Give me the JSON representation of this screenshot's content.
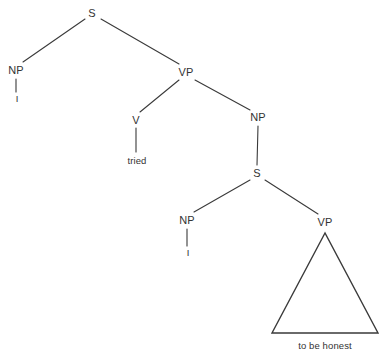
{
  "figure": {
    "type": "syntax-tree",
    "sentence": "I tried to be honest",
    "background_color": "#ffffff",
    "line_color": "#3a3a3a",
    "text_color": "#333333"
  },
  "nodes": [
    {
      "id": "s-top",
      "label": "S",
      "kind": "category",
      "x": 92,
      "y": 13
    },
    {
      "id": "np-subject",
      "label": "NP",
      "kind": "category",
      "x": 16,
      "y": 70
    },
    {
      "id": "i-upper",
      "label": "I",
      "kind": "terminal",
      "x": 17,
      "y": 98
    },
    {
      "id": "vp-main",
      "label": "VP",
      "kind": "category",
      "x": 186,
      "y": 72
    },
    {
      "id": "v-node",
      "label": "V",
      "kind": "category",
      "x": 136,
      "y": 120
    },
    {
      "id": "tried",
      "label": "tried",
      "kind": "terminal",
      "x": 137,
      "y": 160
    },
    {
      "id": "np-object",
      "label": "NP",
      "kind": "category",
      "x": 258,
      "y": 117
    },
    {
      "id": "s-embedded",
      "label": "S",
      "kind": "category",
      "x": 257,
      "y": 173
    },
    {
      "id": "np-lower",
      "label": "NP",
      "kind": "category",
      "x": 187,
      "y": 220
    },
    {
      "id": "i-lower",
      "label": "I",
      "kind": "terminal",
      "x": 188,
      "y": 252
    },
    {
      "id": "vp-lower",
      "label": "VP",
      "kind": "category",
      "x": 325,
      "y": 222
    }
  ],
  "edges": [
    {
      "id": "edge-s-np",
      "from": "s-top",
      "to": "np-subject",
      "x1": 85,
      "y1": 19,
      "x2": 23,
      "y2": 62
    },
    {
      "id": "edge-s-vp",
      "from": "s-top",
      "to": "vp-main",
      "x1": 101,
      "y1": 19,
      "x2": 179,
      "y2": 64
    },
    {
      "id": "edge-np-i",
      "from": "np-subject",
      "to": "i-upper",
      "x1": 16,
      "y1": 79,
      "x2": 16,
      "y2": 92
    },
    {
      "id": "edge-vp-v",
      "from": "vp-main",
      "to": "v-node",
      "x1": 179,
      "y1": 80,
      "x2": 140,
      "y2": 112
    },
    {
      "id": "edge-vp-np",
      "from": "vp-main",
      "to": "np-object",
      "x1": 195,
      "y1": 80,
      "x2": 250,
      "y2": 110
    },
    {
      "id": "edge-v-tried",
      "from": "v-node",
      "to": "tried",
      "x1": 136,
      "y1": 128,
      "x2": 136,
      "y2": 152
    },
    {
      "id": "edge-np-s",
      "from": "np-object",
      "to": "s-embedded",
      "x1": 258,
      "y1": 126,
      "x2": 257,
      "y2": 165
    },
    {
      "id": "edge-s-nplower",
      "from": "s-embedded",
      "to": "np-lower",
      "x1": 250,
      "y1": 180,
      "x2": 194,
      "y2": 212
    },
    {
      "id": "edge-s-vplower",
      "from": "s-embedded",
      "to": "vp-lower",
      "x1": 265,
      "y1": 180,
      "x2": 318,
      "y2": 214
    },
    {
      "id": "edge-nplower-i",
      "from": "np-lower",
      "to": "i-lower",
      "x1": 187,
      "y1": 229,
      "x2": 187,
      "y2": 246
    }
  ],
  "triangle": {
    "id": "vp-triangle",
    "label": "to be honest",
    "apex_x": 325,
    "apex_y": 233,
    "left_x": 272,
    "left_y": 333,
    "right_x": 378,
    "right_y": 333,
    "label_x": 325,
    "label_y": 345
  }
}
